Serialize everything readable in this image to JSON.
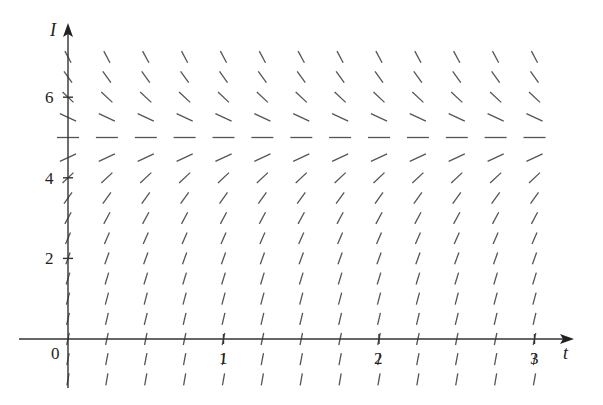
{
  "diagram": {
    "type": "slope_field",
    "equation_form": "dI/dt = k(5 - I)",
    "equilibrium_I": 5,
    "axes": {
      "x_label": "t",
      "y_label": "I",
      "x_ticks": [
        {
          "value": 1,
          "label": "1"
        },
        {
          "value": 2,
          "label": "2"
        },
        {
          "value": 3,
          "label": "3"
        }
      ],
      "y_ticks": [
        {
          "value": 2,
          "label": "2"
        },
        {
          "value": 4,
          "label": "4"
        },
        {
          "value": 6,
          "label": "6"
        }
      ],
      "origin_label": "0"
    },
    "grid": {
      "t_start": 0,
      "t_end": 3,
      "t_step": 0.25,
      "I_start": -1,
      "I_end": 7,
      "I_step": 0.5
    },
    "colors": {
      "axis": "#333333",
      "segment": "#555555",
      "text": "#222222"
    }
  },
  "chart_data": {
    "type": "slope_field",
    "title": "",
    "xlabel": "t",
    "ylabel": "I",
    "xlim": [
      0,
      3
    ],
    "ylim": [
      -1,
      7
    ],
    "x_ticks": [
      1,
      2,
      3
    ],
    "y_ticks": [
      2,
      4,
      6
    ],
    "equilibrium": 5,
    "slope_sign": {
      "below_5": "positive",
      "at_5": "zero",
      "above_5": "negative"
    }
  }
}
